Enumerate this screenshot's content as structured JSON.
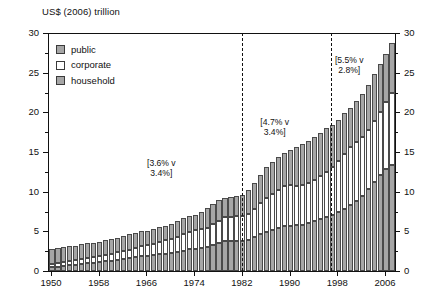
{
  "chart_data": {
    "type": "bar",
    "title": "US$ (2006) trillion",
    "xlabel": "",
    "ylabel": "US$ (2006) trillion",
    "stacked": true,
    "grid": false,
    "legend_position": "top-left",
    "ylim": [
      0,
      30
    ],
    "y_ticks": [
      0,
      5,
      10,
      15,
      20,
      25,
      30
    ],
    "y_ticks_right": [
      0,
      5,
      10,
      15,
      20,
      25,
      30
    ],
    "y_minor_ticks": [
      2.5,
      7.5,
      12.5,
      17.5,
      22.5,
      27.5
    ],
    "x_tick_labels": [
      "1950",
      "1958",
      "1966",
      "1974",
      "1982",
      "1990",
      "1998",
      "2006"
    ],
    "x_tick_years": [
      1950,
      1958,
      1966,
      1974,
      1982,
      1990,
      1998,
      2006
    ],
    "xlim": [
      1949.5,
      2007.5
    ],
    "categories": [
      1950,
      1951,
      1952,
      1953,
      1954,
      1955,
      1956,
      1957,
      1958,
      1959,
      1960,
      1961,
      1962,
      1963,
      1964,
      1965,
      1966,
      1967,
      1968,
      1969,
      1970,
      1971,
      1972,
      1973,
      1974,
      1975,
      1976,
      1977,
      1978,
      1979,
      1980,
      1981,
      1982,
      1983,
      1984,
      1985,
      1986,
      1987,
      1988,
      1989,
      1990,
      1991,
      1992,
      1993,
      1994,
      1995,
      1996,
      1997,
      1998,
      1999,
      2000,
      2001,
      2002,
      2003,
      2004,
      2005,
      2006,
      2007
    ],
    "series": [
      {
        "name": "household",
        "color": "#a6a6a6",
        "values": [
          0.45,
          0.55,
          0.62,
          0.7,
          0.8,
          0.92,
          1.0,
          1.05,
          1.12,
          1.25,
          1.32,
          1.4,
          1.5,
          1.62,
          1.74,
          1.86,
          1.94,
          2.0,
          2.1,
          2.2,
          2.26,
          2.4,
          2.58,
          2.74,
          2.8,
          2.86,
          3.02,
          3.28,
          3.54,
          3.76,
          3.8,
          3.78,
          3.76,
          3.96,
          4.26,
          4.62,
          4.92,
          5.16,
          5.44,
          5.64,
          5.72,
          5.74,
          5.82,
          6.0,
          6.3,
          6.56,
          6.82,
          7.06,
          7.42,
          7.88,
          8.28,
          8.82,
          9.5,
          10.3,
          11.2,
          12.1,
          12.8,
          13.4
        ]
      },
      {
        "name": "corporate",
        "color": "#ffffff",
        "values": [
          0.4,
          0.44,
          0.48,
          0.52,
          0.56,
          0.62,
          0.68,
          0.72,
          0.76,
          0.82,
          0.88,
          0.94,
          1.0,
          1.08,
          1.16,
          1.26,
          1.36,
          1.44,
          1.56,
          1.7,
          1.82,
          1.92,
          2.06,
          2.24,
          2.36,
          2.38,
          2.46,
          2.62,
          2.82,
          3.0,
          3.06,
          3.1,
          3.14,
          3.26,
          3.58,
          3.92,
          4.3,
          4.54,
          4.82,
          5.04,
          5.08,
          5.0,
          4.96,
          5.04,
          5.2,
          5.46,
          5.72,
          6.02,
          6.46,
          6.9,
          7.3,
          7.5,
          7.44,
          7.5,
          7.7,
          8.0,
          8.5,
          9.1
        ]
      },
      {
        "name": "public",
        "color": "#a6a6a6",
        "values": [
          1.95,
          1.91,
          1.9,
          1.88,
          1.84,
          1.86,
          1.82,
          1.78,
          1.82,
          1.85,
          1.8,
          1.86,
          1.9,
          1.92,
          1.9,
          1.88,
          1.8,
          1.86,
          1.88,
          1.8,
          1.82,
          1.96,
          2.0,
          1.96,
          1.94,
          2.26,
          2.42,
          2.5,
          2.54,
          2.48,
          2.52,
          2.52,
          2.7,
          3.04,
          3.26,
          3.56,
          3.88,
          4.02,
          4.16,
          4.22,
          4.44,
          4.86,
          5.18,
          5.36,
          5.4,
          5.44,
          5.44,
          5.32,
          5.2,
          5.16,
          5.0,
          5.08,
          5.36,
          5.7,
          5.9,
          6.0,
          6.1,
          6.3
        ]
      }
    ],
    "annotations": [
      {
        "text": "[3.6% v\n3.4%]",
        "x_center": 1968.5,
        "y_value": 13.0,
        "period": "1950-1982"
      },
      {
        "text": "[4.7% v\n3.4%]",
        "x_center": 1987.5,
        "y_value": 18.2,
        "period": "1982-1997"
      },
      {
        "text": "[5.5% v\n2.8%]",
        "x_center": 2000.0,
        "y_value": 26.0,
        "period": "1997-2007"
      }
    ],
    "vertical_lines": [
      {
        "x": 1982,
        "style": "dash-dot"
      },
      {
        "x": 1997,
        "style": "dash-dot"
      }
    ]
  },
  "legend": {
    "items": [
      {
        "label": "public",
        "color": "#a6a6a6"
      },
      {
        "label": "corporate",
        "color": "#ffffff"
      },
      {
        "label": "household",
        "color": "#a6a6a6"
      }
    ]
  }
}
